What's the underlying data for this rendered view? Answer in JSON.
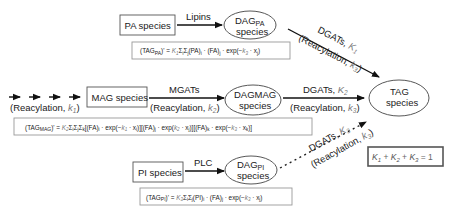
{
  "pathways": {
    "pa": {
      "source": "PA species",
      "enzyme": "Lipins",
      "product_main": "DAG",
      "product_sub": "PA",
      "product_line2": "species",
      "to_tag_enzyme": "DGATs, ",
      "to_tag_k": "K",
      "to_tag_k_sub": "1",
      "to_tag_reacyl": "(Reacylation, ",
      "to_tag_reacyl_k": "k",
      "to_tag_reacyl_sub": "3",
      "equation": {
        "lhs": "(TAG",
        "lhs_sub": "PA",
        "lhs_end": ")' = ",
        "K": "K",
        "K_sub": "1",
        "body": "Σ",
        "i": "i",
        "j": "j",
        "rest": "(PA)",
        "rest2": " · (FA)",
        "rest3": " · exp(−",
        "k": "k",
        "k_sub": "3",
        "tail": " · x",
        "tail_sub": "j",
        "close": ")"
      }
    },
    "mag": {
      "upstream_label": "(Reacylation, ",
      "upstream_k": "k",
      "upstream_k_sub": "1",
      "source": "MAG species",
      "enzyme": "MGATs",
      "reacyl": "(Reacylation, ",
      "reacyl_k": "k",
      "reacyl_sub": "2",
      "product_line1": "DAGMAG",
      "product_line2": "species",
      "to_tag_enzyme": "DGATs, ",
      "to_tag_k": "K",
      "to_tag_k_sub": "2",
      "to_tag_reacyl": "(Reacylation, ",
      "to_tag_reacyl_k": "k",
      "to_tag_reacyl_sub": "3",
      "equation_text": "(TAG_MAG)' = K2 Σi Σj Σk [(FA)i · exp(−k1 · xi)][(FA)j · exp(k2 · xj)][(FA)k · exp(−k3 · xk)]"
    },
    "pi": {
      "source": "PI species",
      "enzyme": "PLC",
      "product_main": "DAG",
      "product_sub": "PI",
      "product_line2": "species",
      "to_tag_enzyme": "DGATs, ",
      "to_tag_k": "K",
      "to_tag_k_sub": "3",
      "to_tag_reacyl": "(Reacylation, ",
      "to_tag_reacyl_k": "k",
      "to_tag_reacyl_sub": "3",
      "equation_text": "(TAG_PI)' = K3 Σi Σj (PI)i · (FA)j · exp(−k3 · xj)"
    }
  },
  "target": {
    "line1": "TAG",
    "line2": "species"
  },
  "constraint": {
    "text": "K1 + K2 + K3 = 1"
  },
  "colors": {
    "arrow": "#111111",
    "k_param": "#777777",
    "box_border": "#555555",
    "equation_border": "#999999"
  }
}
